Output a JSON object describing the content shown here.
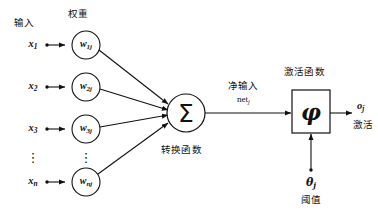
{
  "diagram": {
    "title_present": false,
    "type": "artificial-neuron-model",
    "language": "zh-CN",
    "stroke_color": "#111111",
    "background_color": "#ffffff"
  },
  "labels": {
    "input_header": "输入",
    "weight_header": "权重",
    "transfer_function": "转换函数",
    "net_input": "净输入",
    "net_input_symbol": "net",
    "net_input_subscript": "j",
    "activation_function_header": "激活函数",
    "activation_output_label": "激活",
    "threshold_label": "阈值"
  },
  "inputs": [
    {
      "name": "x",
      "subscript": "1",
      "weight_name": "w",
      "weight_subscript": "1j"
    },
    {
      "name": "x",
      "subscript": "2",
      "weight_name": "w",
      "weight_subscript": "2j"
    },
    {
      "name": "x",
      "subscript": "3",
      "weight_name": "w",
      "weight_subscript": "3j"
    },
    {
      "name": "x",
      "subscript": "n",
      "weight_name": "w",
      "weight_subscript": "nj"
    }
  ],
  "ellipsis": {
    "inputs_column": "⋮",
    "weights_column": "⋮"
  },
  "summation": {
    "symbol": "Σ"
  },
  "activation": {
    "symbol": "φ"
  },
  "threshold": {
    "symbol": "θ",
    "subscript": "j"
  },
  "output": {
    "symbol": "o",
    "subscript": "j"
  }
}
